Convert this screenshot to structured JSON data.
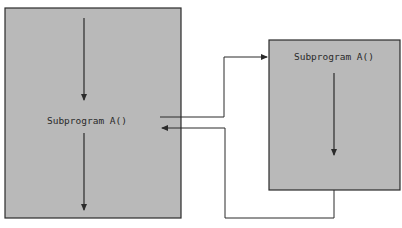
{
  "diagram": {
    "title": "",
    "colors": {
      "box_fill": "#b9b9b9",
      "box_stroke": "#2b2b2b",
      "line": "#2b2b2b",
      "background": "#ffffff"
    },
    "main_program": {
      "label": "Subprogram A()",
      "flow": [
        "down-arrow-before-call",
        "call-site",
        "down-arrow-after-call"
      ]
    },
    "called_subprogram": {
      "label": "Subprogram A()",
      "flow": [
        "down-arrow-body"
      ]
    },
    "connectors": [
      {
        "name": "call",
        "from": "main_program",
        "to": "called_subprogram"
      },
      {
        "name": "return",
        "from": "called_subprogram",
        "to": "main_program"
      }
    ]
  }
}
